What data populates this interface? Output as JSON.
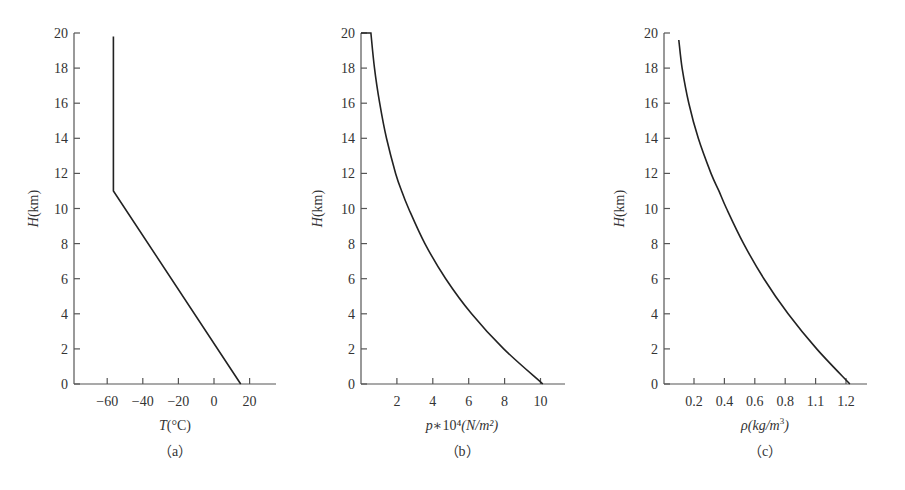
{
  "chart_data": [
    {
      "type": "line",
      "panel": "(a)",
      "caption": "（a）",
      "xlabel_italic": "T",
      "xlabel_rest": "(°C)",
      "ylabel_italic": "H",
      "ylabel_rest": "(km)",
      "xticks": [
        "-60",
        "-40",
        "-20",
        "0",
        "20"
      ],
      "xtick_values": [
        -60,
        -40,
        -20,
        0,
        20
      ],
      "yticks": [
        "0",
        "2",
        "4",
        "6",
        "8",
        "10",
        "12",
        "14",
        "16",
        "18",
        "20"
      ],
      "xlim": [
        -78,
        32
      ],
      "ylim": [
        0,
        20
      ],
      "series": [
        {
          "name": "Temperature",
          "x": [
            15,
            -56.5,
            -56.5
          ],
          "y": [
            0,
            11,
            19.8
          ]
        }
      ]
    },
    {
      "type": "line",
      "panel": "(b)",
      "caption": "（b）",
      "xlabel_italic": "p",
      "xlabel_rest": "∗10⁴",
      "xlabel_unit": "(N/m²)",
      "ylabel_italic": "H",
      "ylabel_rest": "(km)",
      "xticks": [
        "2",
        "4",
        "6",
        "8",
        "10"
      ],
      "xtick_values": [
        2,
        4,
        6,
        8,
        10
      ],
      "yticks": [
        "0",
        "2",
        "4",
        "6",
        "8",
        "10",
        "12",
        "14",
        "16",
        "18",
        "20"
      ],
      "xlim": [
        0,
        11.3
      ],
      "ylim": [
        0,
        20
      ],
      "series": [
        {
          "name": "Pressure",
          "x": [
            10.13,
            7.95,
            6.16,
            4.72,
            3.56,
            2.65,
            2.26,
            1.93,
            1.42,
            1.04,
            0.75,
            0.55,
            0.0
          ],
          "y": [
            0,
            2,
            4,
            6,
            8,
            10,
            11,
            12,
            14,
            16,
            18,
            20,
            20
          ]
        }
      ]
    },
    {
      "type": "line",
      "panel": "(c)",
      "caption": "（c）",
      "xlabel_italic": "ρ(kg/m",
      "xlabel_sup": "3",
      "xlabel_rest": ")",
      "ylabel_italic": "H",
      "ylabel_rest": "(km)",
      "xticks": [
        "0.2",
        "0.4",
        "0.6",
        "0.8",
        "1.1",
        "1.2"
      ],
      "xtick_values": [
        0.2,
        0.4,
        0.6,
        0.8,
        1.0,
        1.2
      ],
      "yticks": [
        "0",
        "2",
        "4",
        "6",
        "8",
        "10",
        "12",
        "14",
        "16",
        "18",
        "20"
      ],
      "xlim": [
        0,
        1.34
      ],
      "ylim": [
        0,
        20
      ],
      "series": [
        {
          "name": "Density",
          "x": [
            1.225,
            1.007,
            0.819,
            0.66,
            0.526,
            0.414,
            0.364,
            0.312,
            0.228,
            0.166,
            0.122,
            0.1
          ],
          "y": [
            0,
            2,
            4,
            6,
            8,
            10,
            11,
            12,
            14,
            16,
            18,
            19.6
          ]
        }
      ]
    }
  ]
}
